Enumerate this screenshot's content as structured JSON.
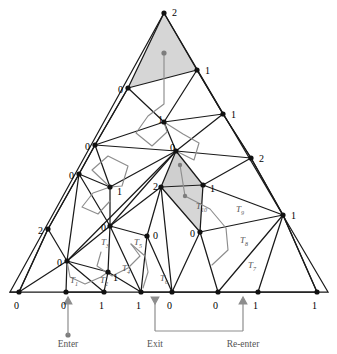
{
  "figure": {
    "colors": {
      "edge": "#1a1a1a",
      "path": "#8d8d8d",
      "shade": "#d4d4d4",
      "vertex": "#111111",
      "label": "#000000",
      "caption": "#555555"
    }
  },
  "captions": [
    {
      "id": "enter",
      "text": "Enter",
      "x": 68,
      "y": 347
    },
    {
      "id": "exit",
      "text": "Exit",
      "x": 155,
      "y": 347
    },
    {
      "id": "re-enter",
      "text": "Re-enter",
      "x": 243,
      "y": 347
    }
  ],
  "triangle_labels": [
    {
      "name": "T1",
      "text": "T",
      "sub": "1",
      "x": 70,
      "y": 283
    },
    {
      "name": "T2",
      "text": "T",
      "sub": "2",
      "x": 100,
      "y": 283
    },
    {
      "name": "T3",
      "text": "T",
      "sub": "3",
      "x": 101,
      "y": 245
    },
    {
      "name": "T4",
      "text": "T",
      "sub": "4",
      "x": 122,
      "y": 271
    },
    {
      "name": "T5",
      "text": "T",
      "sub": "5",
      "x": 134,
      "y": 245
    },
    {
      "name": "T6",
      "text": "T",
      "sub": "6",
      "x": 160,
      "y": 281
    },
    {
      "name": "T7",
      "text": "T",
      "sub": "7",
      "x": 248,
      "y": 268
    },
    {
      "name": "T8",
      "text": "T",
      "sub": "8",
      "x": 240,
      "y": 243
    },
    {
      "name": "T9",
      "text": "T",
      "sub": "9",
      "x": 236,
      "y": 212
    },
    {
      "name": "T10",
      "text": "T",
      "sub": "10",
      "x": 196,
      "y": 209
    }
  ],
  "vertices": [
    {
      "name": "apex",
      "label": "2",
      "x": 164,
      "y": 13,
      "lx": 172,
      "ly": 12
    },
    {
      "name": "v-left-1",
      "label": "0",
      "x": 128,
      "y": 88,
      "lx": 118,
      "ly": 89
    },
    {
      "name": "v-right-1",
      "label": "1",
      "x": 197,
      "y": 70,
      "lx": 205,
      "ly": 70
    },
    {
      "name": "v-mid-1",
      "label": "1",
      "x": 164,
      "y": 122,
      "lx": 158,
      "ly": 119
    },
    {
      "name": "v-left-2",
      "label": "0",
      "x": 95,
      "y": 145,
      "lx": 85,
      "ly": 146
    },
    {
      "name": "v-right-2",
      "label": "1",
      "x": 223,
      "y": 114,
      "lx": 231,
      "ly": 114
    },
    {
      "name": "v-center",
      "label": "0",
      "x": 176,
      "y": 151,
      "lx": 170,
      "ly": 147
    },
    {
      "name": "v-right-3",
      "label": "2",
      "x": 251,
      "y": 158,
      "lx": 259,
      "ly": 158
    },
    {
      "name": "v-left-3",
      "label": "0",
      "x": 79,
      "y": 174,
      "lx": 69,
      "ly": 175
    },
    {
      "name": "v-in-left",
      "label": "1",
      "x": 110,
      "y": 187,
      "lx": 117,
      "ly": 191
    },
    {
      "name": "v-mid-2",
      "label": "2",
      "x": 161,
      "y": 187,
      "lx": 153,
      "ly": 186
    },
    {
      "name": "v-mid-3",
      "label": "1",
      "x": 203,
      "y": 185,
      "lx": 210,
      "ly": 188
    },
    {
      "name": "v-left-4",
      "label": "2",
      "x": 48,
      "y": 229,
      "lx": 38,
      "ly": 230
    },
    {
      "name": "v-hub",
      "label": "0",
      "x": 67,
      "y": 261,
      "lx": 57,
      "ly": 262
    },
    {
      "name": "v-low-left",
      "label": "0",
      "x": 110,
      "y": 226,
      "lx": 101,
      "ly": 227
    },
    {
      "name": "v-low-mid",
      "label": "0",
      "x": 147,
      "y": 236,
      "lx": 153,
      "ly": 235
    },
    {
      "name": "v-low-right",
      "label": "0",
      "x": 200,
      "y": 232,
      "lx": 190,
      "ly": 233
    },
    {
      "name": "v-far-right",
      "label": "1",
      "x": 283,
      "y": 215,
      "lx": 291,
      "ly": 215
    },
    {
      "name": "v-inner-1",
      "label": "1",
      "x": 108,
      "y": 272,
      "lx": 113,
      "ly": 277
    },
    {
      "name": "b0",
      "label": "0",
      "x": 19,
      "y": 292,
      "lx": 14,
      "ly": 305
    },
    {
      "name": "b1",
      "label": "0",
      "x": 66,
      "y": 292,
      "lx": 61,
      "ly": 305
    },
    {
      "name": "b2",
      "label": "1",
      "x": 104,
      "y": 292,
      "lx": 99,
      "ly": 305
    },
    {
      "name": "b3",
      "label": "1",
      "x": 141,
      "y": 292,
      "lx": 136,
      "ly": 305
    },
    {
      "name": "b4",
      "label": "0",
      "x": 172,
      "y": 292,
      "lx": 167,
      "ly": 305
    },
    {
      "name": "b5",
      "label": "0",
      "x": 218,
      "y": 292,
      "lx": 213,
      "ly": 305
    },
    {
      "name": "b6",
      "label": "1",
      "x": 258,
      "y": 292,
      "lx": 253,
      "ly": 305
    },
    {
      "name": "b7",
      "label": "1",
      "x": 317,
      "y": 292,
      "lx": 312,
      "ly": 305
    },
    {
      "name": "v-extra-1",
      "label": "",
      "x": 10,
      "y": 292,
      "lx": 0,
      "ly": 0
    }
  ],
  "shaded_regions": [
    {
      "name": "top-simplex",
      "points": "164,13 128,88 197,70"
    },
    {
      "name": "inner-simplex",
      "points": "176,151 161,187 203,185"
    },
    {
      "name": "inner-lower",
      "points": "161,187 203,185 200,232"
    }
  ],
  "path_markers": [
    {
      "name": "start-dot-top",
      "x": 164,
      "y": 53
    },
    {
      "name": "dot-inner-1",
      "x": 180,
      "y": 165
    },
    {
      "name": "dot-inner-2",
      "x": 185,
      "y": 196
    },
    {
      "name": "enter-dot",
      "x": 68,
      "y": 335
    }
  ],
  "arrows": [
    {
      "name": "enter-arrow",
      "x": 68,
      "y": 300,
      "dir": "up"
    },
    {
      "name": "exit-arrow",
      "x": 155,
      "y": 300,
      "dir": "down"
    },
    {
      "name": "re-enter-arrow",
      "x": 243,
      "y": 300,
      "dir": "up"
    }
  ]
}
